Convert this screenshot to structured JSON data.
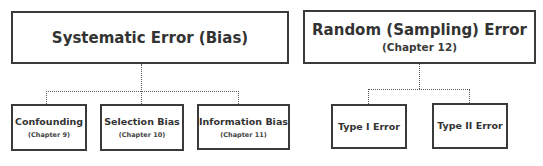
{
  "diagram": {
    "type": "hierarchy",
    "groups": [
      {
        "title": "Systematic Error (Bias)",
        "subtitle": "",
        "children": [
          {
            "title": "Confounding",
            "subtitle": "(Chapter 9)"
          },
          {
            "title": "Selection Bias",
            "subtitle": "(Chapter 10)"
          },
          {
            "title": "Information Bias",
            "subtitle": "(Chapter 11)"
          }
        ]
      },
      {
        "title": "Random (Sampling) Error",
        "subtitle": "(Chapter 12)",
        "children": [
          {
            "title": "Type I Error",
            "subtitle": ""
          },
          {
            "title": "Type II Error",
            "subtitle": ""
          }
        ]
      }
    ],
    "connector_style": "dotted",
    "colors": {
      "border": "#3a3a3a",
      "text": "#333333",
      "connector": "#555555",
      "background": "#ffffff"
    }
  }
}
